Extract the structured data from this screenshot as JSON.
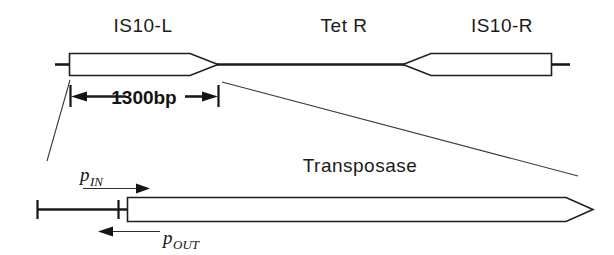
{
  "figure": {
    "width": 614,
    "height": 255,
    "background": "#ffffff",
    "line_color": "#1f1f1f",
    "text_color": "#141414"
  },
  "top_panel": {
    "labels": {
      "is10_left": "IS10-L",
      "tet_r": "Tet R",
      "is10_right": "IS10-R"
    },
    "dimension": {
      "value": "1300bp",
      "start_px": 70,
      "end_px": 218,
      "arrow_style": "outward-double"
    },
    "elements": [
      {
        "name": "is10-left-box",
        "shape": "rect-taper-right",
        "x": 69,
        "width": 149,
        "y": 53,
        "height": 23
      },
      {
        "name": "tet-r-backbone",
        "shape": "line",
        "x1": 218,
        "x2": 403,
        "y": 64
      },
      {
        "name": "is10-right-box",
        "shape": "rect-taper-left",
        "x": 403,
        "width": 148,
        "y": 53,
        "height": 23
      }
    ]
  },
  "bottom_panel": {
    "labels": {
      "transposase": "Transposase",
      "p_in_main": "p",
      "p_in_sub": "IN",
      "p_out_main": "p",
      "p_out_sub": "OUT"
    },
    "elements": [
      {
        "name": "upstream-baseline",
        "shape": "line",
        "x1": 37,
        "x2": 127,
        "y": 209
      },
      {
        "name": "transposase-arrow",
        "shape": "block-arrow-right",
        "x": 127,
        "width": 466,
        "y": 197,
        "height": 24
      }
    ],
    "promoters": [
      {
        "name": "p-IN",
        "direction": "right",
        "arrow_y": 188
      },
      {
        "name": "p-OUT",
        "direction": "left",
        "arrow_y": 231
      }
    ]
  },
  "leader_lines": [
    {
      "name": "left-leader",
      "x1": 70,
      "y1": 80,
      "x2": 47,
      "y2": 161
    },
    {
      "name": "right-leader",
      "x1": 222,
      "y1": 82,
      "x2": 578,
      "y2": 176
    }
  ]
}
